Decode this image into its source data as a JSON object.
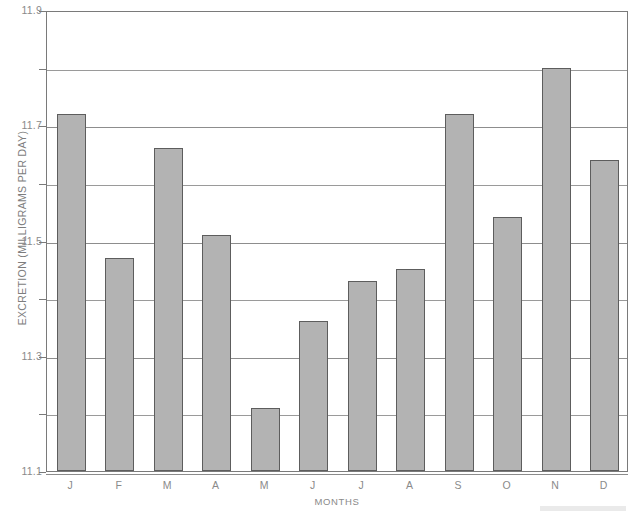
{
  "chart_data": {
    "type": "bar",
    "title": "",
    "xlabel": "MONTHS",
    "ylabel": "EXCRETION (MILLIGRAMS PER DAY)",
    "categories": [
      "J",
      "F",
      "M",
      "A",
      "M",
      "J",
      "J",
      "A",
      "S",
      "O",
      "N",
      "D"
    ],
    "category_names": [
      "January",
      "February",
      "March",
      "April",
      "May",
      "June",
      "July",
      "August",
      "September",
      "October",
      "November",
      "December"
    ],
    "values": [
      11.72,
      11.47,
      11.66,
      11.51,
      11.21,
      11.36,
      11.43,
      11.45,
      11.72,
      11.54,
      11.8,
      11.64
    ],
    "ylim": [
      11.1,
      11.9
    ],
    "ytick_labels": [
      "11.9",
      "11.7",
      "11.5",
      "11.3",
      "11.1"
    ],
    "ytick_values": [
      11.9,
      11.7,
      11.5,
      11.3,
      11.1
    ],
    "minor_ytick_values": [
      11.8,
      11.6,
      11.4,
      11.2
    ],
    "grid": true,
    "legend": "none",
    "bar_color": "#b3b3b3",
    "bar_edge_color": "#5d5d5d",
    "axis_color": "#7a7a7a",
    "grid_color": "#8d8d8d",
    "text_color": "#8a8a8a",
    "background": "#ffffff"
  }
}
